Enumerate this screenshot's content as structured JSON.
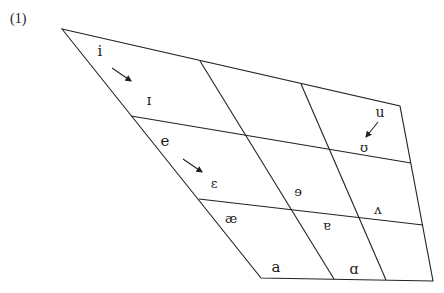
{
  "figure": {
    "number_label": "(1)",
    "type": "vowel-quadrilateral",
    "line_color": "#222222",
    "text_color": "#1a1a1a"
  },
  "outline": {
    "top_left": [
      62,
      29
    ],
    "top_right": [
      400,
      106
    ],
    "bottom_right": [
      433,
      281
    ],
    "bottom_left": [
      261,
      278
    ]
  },
  "grid_lines": {
    "horizontal": [
      {
        "from": [
          131,
          116
        ],
        "to": [
          411,
          163
        ]
      },
      {
        "from": [
          199,
          199
        ],
        "to": [
          423,
          225
        ]
      }
    ],
    "vertical": [
      {
        "from": [
          200,
          61
        ],
        "to": [
          334,
          279
        ]
      },
      {
        "from": [
          301,
          84
        ],
        "to": [
          386,
          280
        ]
      }
    ]
  },
  "vowels": [
    {
      "symbol": "i",
      "x": 100,
      "y": 56,
      "size": 15
    },
    {
      "symbol": "ɪ",
      "x": 149,
      "y": 105,
      "size": 14
    },
    {
      "symbol": "e",
      "x": 165,
      "y": 146,
      "size": 15
    },
    {
      "symbol": "ɛ",
      "x": 214,
      "y": 188,
      "size": 13
    },
    {
      "symbol": "æ",
      "x": 231,
      "y": 223,
      "size": 13
    },
    {
      "symbol": "a",
      "x": 276,
      "y": 272,
      "size": 15
    },
    {
      "symbol": "ɘ",
      "x": 298,
      "y": 196,
      "size": 13
    },
    {
      "symbol": "ɐ",
      "x": 327,
      "y": 230,
      "size": 13
    },
    {
      "symbol": "u",
      "x": 380,
      "y": 117,
      "size": 14
    },
    {
      "symbol": "ʊ",
      "x": 364,
      "y": 152,
      "size": 13
    },
    {
      "symbol": "ʌ",
      "x": 378,
      "y": 214,
      "size": 13
    },
    {
      "symbol": "ɑ",
      "x": 354,
      "y": 274,
      "size": 14
    }
  ],
  "arrows": [
    {
      "from": [
        112,
        68
      ],
      "to": [
        131,
        81
      ],
      "description": "i to ɪ"
    },
    {
      "from": [
        183,
        159
      ],
      "to": [
        202,
        172
      ],
      "description": "e to ɛ"
    },
    {
      "from": [
        378,
        122
      ],
      "to": [
        366,
        137
      ],
      "description": "u to ʊ"
    }
  ]
}
